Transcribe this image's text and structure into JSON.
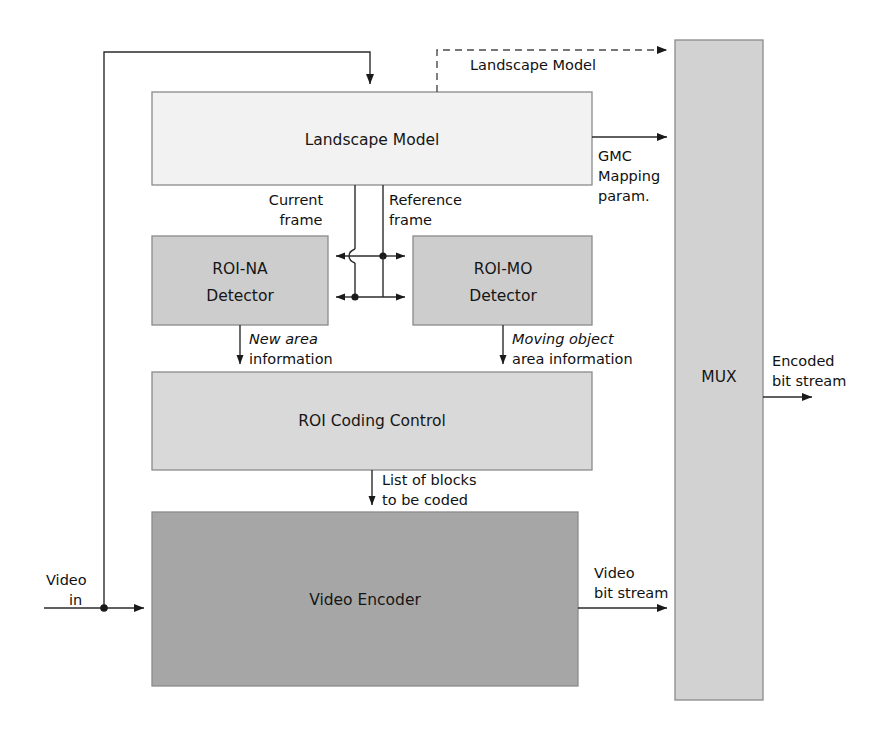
{
  "figure": {
    "name": "roi-video-coding-block-diagram",
    "background": "#ffffff",
    "width": 886,
    "height": 739
  },
  "palette": {
    "light_fill": "#f2f2f2",
    "mid_fill": "#cdcdcd",
    "mux_fill": "#d2d2d2",
    "dark_fill": "#a6a6a6",
    "border": "#8a8a8a",
    "wire": "#2b2b2b",
    "text": "#161616"
  },
  "blocks": {
    "landscape_model": {
      "label": "Landscape Model",
      "x": 152,
      "y": 92,
      "w": 440,
      "h": 93,
      "fill": "#f2f2f2"
    },
    "roi_na_detector": {
      "label_line1": "ROI-NA",
      "label_line2": "Detector",
      "x": 152,
      "y": 236,
      "w": 176,
      "h": 89,
      "fill": "#cdcdcd"
    },
    "roi_mo_detector": {
      "label_line1": "ROI-MO",
      "label_line2": "Detector",
      "x": 413,
      "y": 236,
      "w": 179,
      "h": 89,
      "fill": "#cdcdcd"
    },
    "roi_coding_control": {
      "label": "ROI Coding Control",
      "x": 152,
      "y": 372,
      "w": 440,
      "h": 98,
      "fill": "#d9d9d9"
    },
    "video_encoder": {
      "label": "Video Encoder",
      "x": 152,
      "y": 512,
      "w": 426,
      "h": 174,
      "fill": "#a6a6a6"
    },
    "mux": {
      "label": "MUX",
      "x": 675,
      "y": 40,
      "w": 88,
      "h": 660,
      "fill": "#d2d2d2"
    }
  },
  "edge_labels": {
    "landscape_model_to_mux": "Landscape Model",
    "gmc_line1": "GMC",
    "gmc_line2": "Mapping",
    "gmc_line3": "param.",
    "current_frame_line1": "Current",
    "current_frame_line2": "frame",
    "reference_frame_line1": "Reference",
    "reference_frame_line2": "frame",
    "new_area_emph": "New area",
    "new_area_rest": "information",
    "moving_object_emph": "Moving object",
    "moving_object_rest": "area information",
    "list_of_blocks_line1": "List of blocks",
    "list_of_blocks_line2": "to be coded",
    "video_in_line1": "Video",
    "video_in_line2": "in",
    "video_bit_stream_line1": "Video",
    "video_bit_stream_line2": "bit stream",
    "encoded_bit_stream_line1": "Encoded",
    "encoded_bit_stream_line2": "bit stream"
  }
}
